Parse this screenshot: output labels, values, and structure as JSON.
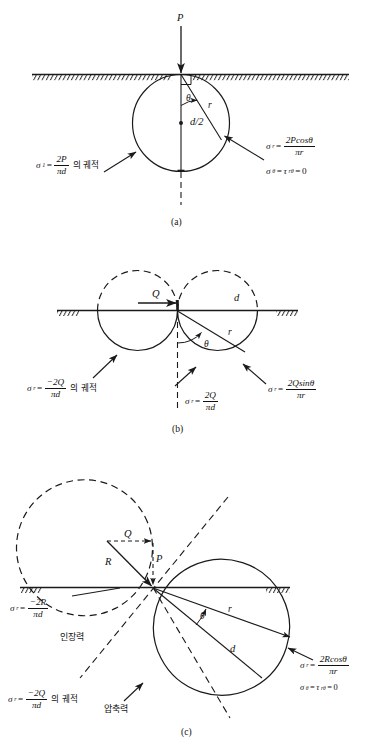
{
  "figure": {
    "ink_color": "#1a1a1a",
    "background_color": "#ffffff",
    "panels": [
      {
        "id": "a",
        "label": "(a)",
        "loading": "vertical point load",
        "force_labels": [
          {
            "name": "applied-load",
            "text": "P"
          }
        ],
        "geometry_labels": [
          {
            "name": "angle-theta",
            "text": "θ"
          },
          {
            "name": "radius-r",
            "text": "r"
          },
          {
            "name": "diameter-half",
            "text": "d/2"
          }
        ],
        "equations": [
          {
            "name": "principal-stress-locus",
            "lhs_symbol": "σ",
            "lhs_sub": "1",
            "num": "2P",
            "den": "πd",
            "suffix_korean": "의 궤적"
          },
          {
            "name": "radial-stress",
            "lhs_symbol": "σ",
            "lhs_sub": "r",
            "num": "2Pcosθ",
            "den": "πr"
          },
          {
            "name": "hoop-and-shear-zero",
            "text": "σθ = τrθ = 0"
          }
        ]
      },
      {
        "id": "b",
        "label": "(b)",
        "loading": "horizontal point load",
        "force_labels": [
          {
            "name": "applied-load",
            "text": "Q"
          }
        ],
        "geometry_labels": [
          {
            "name": "angle-theta",
            "text": "θ"
          },
          {
            "name": "radius-r",
            "text": "r"
          },
          {
            "name": "diameter-d",
            "text": "d"
          }
        ],
        "equations": [
          {
            "name": "tensile-locus",
            "lhs_symbol": "σ",
            "lhs_sub": "r",
            "num": "−2Q",
            "den": "πd",
            "suffix_korean": "의 궤적"
          },
          {
            "name": "compressive-locus",
            "lhs_symbol": "σ",
            "lhs_sub": "r",
            "num": "2Q",
            "den": "πd"
          },
          {
            "name": "radial-stress",
            "lhs_symbol": "σ",
            "lhs_sub": "r",
            "num": "2Qsinθ",
            "den": "πr"
          }
        ]
      },
      {
        "id": "c",
        "label": "(c)",
        "loading": "inclined resultant load",
        "force_labels": [
          {
            "name": "horizontal-component",
            "text": "Q"
          },
          {
            "name": "resultant-force",
            "text": "R"
          },
          {
            "name": "vertical-component",
            "text": "P"
          }
        ],
        "geometry_labels": [
          {
            "name": "angle-theta",
            "text": "θ"
          },
          {
            "name": "radius-r",
            "text": "r"
          },
          {
            "name": "diameter-d",
            "text": "d"
          }
        ],
        "zone_labels": [
          {
            "name": "tension-zone",
            "text": "인장력"
          },
          {
            "name": "compression-zone",
            "text": "압축력"
          }
        ],
        "equations": [
          {
            "name": "tensile-locus",
            "lhs_symbol": "σ",
            "lhs_sub": "r",
            "num": "−2R",
            "den": "πd"
          },
          {
            "name": "tensile-locus-Q",
            "lhs_symbol": "σ",
            "lhs_sub": "r",
            "num": "−2Q",
            "den": "πd",
            "suffix_korean": "의 궤적"
          },
          {
            "name": "radial-stress",
            "lhs_symbol": "σ",
            "lhs_sub": "r",
            "num": "2Rcosθ",
            "den": "πr"
          },
          {
            "name": "hoop-and-shear-zero",
            "text": "σθ = τrθ = 0"
          }
        ]
      }
    ]
  },
  "text": {
    "sigma": "σ",
    "tau": "τ",
    "theta": "θ",
    "pi": "π",
    "equals": "=",
    "zero": "0",
    "locus_korean": "의 궤적",
    "tension_korean": "인장력",
    "compression_korean": "압축력",
    "P": "P",
    "Q": "Q",
    "R": "R",
    "r": "r",
    "d": "d",
    "d_half": "d/2",
    "label_a": "(a)",
    "label_b": "(b)",
    "label_c": "(c)",
    "sub_1": "1",
    "sub_r": "r",
    "sub_theta": "θ",
    "sub_rtheta": "rθ",
    "num_2P": "2P",
    "num_2Q": "2Q",
    "num_neg2Q": "−2Q",
    "num_neg2R": "−2R",
    "num_2Pcos": "2Pcosθ",
    "num_2Qsin": "2Qsinθ",
    "num_2Rcos": "2Rcosθ",
    "den_pid": "πd",
    "den_pir": "πr"
  }
}
